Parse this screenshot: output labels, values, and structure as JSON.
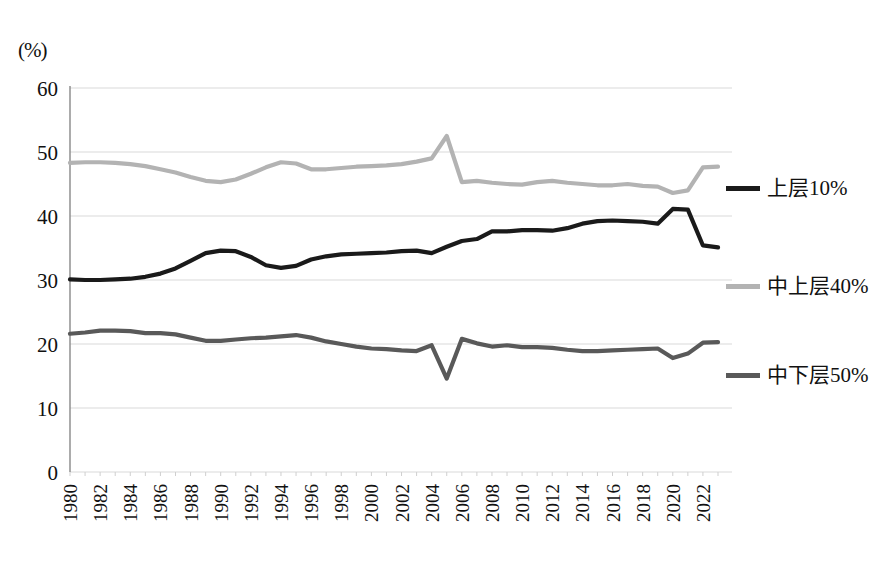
{
  "chart_data": {
    "type": "line",
    "title": "",
    "xlabel": "",
    "ylabel": "(%)",
    "ylim": [
      0,
      60
    ],
    "ytick_values": [
      0,
      10,
      20,
      30,
      40,
      50,
      60
    ],
    "xlim": [
      1980,
      2023
    ],
    "grid": true,
    "legend_position": "right",
    "x": [
      1980,
      1981,
      1982,
      1983,
      1984,
      1985,
      1986,
      1987,
      1988,
      1989,
      1990,
      1991,
      1992,
      1993,
      1994,
      1995,
      1996,
      1997,
      1998,
      1999,
      2000,
      2001,
      2002,
      2003,
      2004,
      2005,
      2006,
      2007,
      2008,
      2009,
      2010,
      2011,
      2012,
      2013,
      2014,
      2015,
      2016,
      2017,
      2018,
      2019,
      2020,
      2021,
      2022,
      2023
    ],
    "xtick_labels": [
      "1980",
      "1982",
      "1984",
      "1986",
      "1988",
      "1990",
      "1992",
      "1994",
      "1996",
      "1998",
      "2000",
      "2002",
      "2004",
      "2006",
      "2008",
      "2010",
      "2012",
      "2014",
      "2016",
      "2018",
      "2020",
      "2022"
    ],
    "series": [
      {
        "name": "上层10%",
        "color": "#1a1a1a",
        "width": 4.2,
        "values": [
          30.1,
          30.0,
          30.0,
          30.1,
          30.2,
          30.5,
          31.0,
          31.8,
          33.0,
          34.2,
          34.6,
          34.5,
          33.6,
          32.3,
          31.9,
          32.2,
          33.2,
          33.7,
          34.0,
          34.1,
          34.2,
          34.3,
          34.5,
          34.6,
          34.2,
          35.2,
          36.1,
          36.4,
          37.6,
          37.6,
          37.8,
          37.8,
          37.7,
          38.1,
          38.8,
          39.2,
          39.3,
          39.2,
          39.1,
          38.8,
          41.1,
          41.0,
          35.4,
          35.1
        ]
      },
      {
        "name": "中上层40%",
        "color": "#b3b3b3",
        "width": 4.2,
        "values": [
          48.3,
          48.4,
          48.4,
          48.3,
          48.1,
          47.8,
          47.3,
          46.8,
          46.1,
          45.5,
          45.3,
          45.7,
          46.6,
          47.6,
          48.4,
          48.2,
          47.3,
          47.3,
          47.5,
          47.7,
          47.8,
          47.9,
          48.1,
          48.5,
          49.0,
          52.5,
          45.3,
          45.5,
          45.2,
          45.0,
          44.9,
          45.3,
          45.5,
          45.2,
          45.0,
          44.8,
          44.8,
          45.0,
          44.7,
          44.6,
          43.6,
          44.0,
          47.6,
          47.7
        ]
      },
      {
        "name": "中下层50%",
        "color": "#595959",
        "width": 4.2,
        "values": [
          21.6,
          21.8,
          22.1,
          22.1,
          22.0,
          21.7,
          21.7,
          21.5,
          21.0,
          20.5,
          20.5,
          20.7,
          20.9,
          21.0,
          21.2,
          21.4,
          21.0,
          20.4,
          20.0,
          19.6,
          19.3,
          19.2,
          19.0,
          18.9,
          19.8,
          14.6,
          20.8,
          20.1,
          19.6,
          19.8,
          19.5,
          19.5,
          19.4,
          19.1,
          18.9,
          18.9,
          19.0,
          19.1,
          19.2,
          19.3,
          17.8,
          18.5,
          20.2,
          20.3
        ]
      }
    ]
  },
  "legend": {
    "items": [
      {
        "label": "上层10%",
        "color": "#1a1a1a"
      },
      {
        "label": "中上层40%",
        "color": "#b3b3b3"
      },
      {
        "label": "中下层50%",
        "color": "#595959"
      }
    ]
  },
  "axis": {
    "unit": "(%)"
  }
}
